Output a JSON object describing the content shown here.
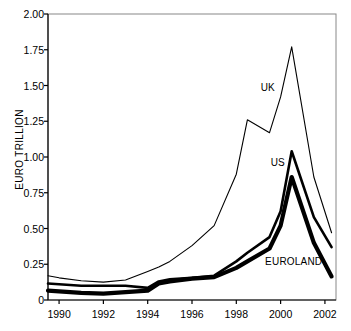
{
  "chart_data": {
    "type": "line",
    "title": "",
    "subtitle": "",
    "xlabel": "",
    "ylabel": "EURO TRILLION",
    "xlim": [
      1989.5,
      2002.5
    ],
    "ylim": [
      0,
      2.0
    ],
    "grid": false,
    "legend_position": "inline-annotations",
    "y_ticks": [
      "0",
      "0.25",
      "0.50",
      "0.75",
      "1.00",
      "1.25",
      "1.50",
      "1.75",
      "2.00"
    ],
    "y_tick_values": [
      0,
      0.25,
      0.5,
      0.75,
      1.0,
      1.25,
      1.5,
      1.75,
      2.0
    ],
    "x_ticks": [
      "1990",
      "1992",
      "1994",
      "1996",
      "1998",
      "2000",
      "2002"
    ],
    "x_tick_values": [
      1990,
      1992,
      1994,
      1996,
      1998,
      2000,
      2002
    ],
    "x": [
      1989.5,
      1990,
      1991,
      1992,
      1993,
      1994,
      1994.5,
      1995,
      1996,
      1997,
      1998,
      1998.5,
      1999.5,
      2000,
      2000.5,
      2001.5,
      2002.3
    ],
    "series": [
      {
        "name": "UK",
        "label": "UK",
        "stroke_width": 1.1,
        "color": "#000000",
        "values": [
          0.17,
          0.155,
          0.135,
          0.125,
          0.14,
          0.2,
          0.23,
          0.27,
          0.38,
          0.52,
          0.88,
          1.26,
          1.17,
          1.42,
          1.77,
          0.86,
          0.47
        ]
      },
      {
        "name": "US",
        "label": "US",
        "stroke_width": 2.6,
        "color": "#000000",
        "values": [
          0.115,
          0.11,
          0.1,
          0.1,
          0.1,
          0.085,
          0.13,
          0.145,
          0.155,
          0.17,
          0.27,
          0.33,
          0.44,
          0.62,
          1.04,
          0.58,
          0.37
        ]
      },
      {
        "name": "EUROLAND",
        "label": "EUROLAND",
        "stroke_width": 4.2,
        "color": "#000000",
        "values": [
          0.065,
          0.06,
          0.05,
          0.045,
          0.055,
          0.065,
          0.115,
          0.13,
          0.15,
          0.16,
          0.225,
          0.27,
          0.36,
          0.52,
          0.86,
          0.4,
          0.165
        ]
      }
    ],
    "annotations": [
      {
        "text": "UK",
        "x": 1999.1,
        "y": 1.48
      },
      {
        "text": "US",
        "x": 1999.55,
        "y": 0.96
      },
      {
        "text": "EUROLAND",
        "x": 1999.3,
        "y": 0.265
      }
    ],
    "axis_color": "#888888",
    "background": "#ffffff"
  }
}
